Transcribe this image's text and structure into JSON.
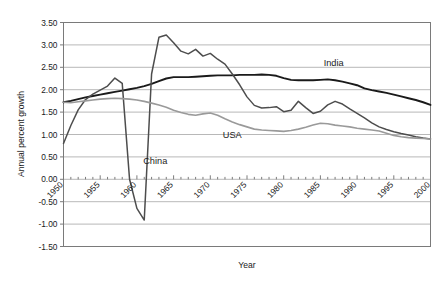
{
  "chart_data": {
    "type": "line",
    "title": "",
    "xlabel": "Year",
    "ylabel": "Annual percent growth",
    "xlim": [
      1950,
      2000
    ],
    "ylim": [
      -1.5,
      3.5
    ],
    "ytick_labels": [
      "3.50",
      "3.00",
      "2.50",
      "2.00",
      "1.50",
      "1.00",
      "0.50",
      "0.00",
      "-0.50",
      "-1.00",
      "-1.50"
    ],
    "ytick_values": [
      3.5,
      3.0,
      2.5,
      2.0,
      1.5,
      1.0,
      0.5,
      0.0,
      -0.5,
      -1.0,
      -1.5
    ],
    "xtick_labels": [
      "1950",
      "1955",
      "1960",
      "1965",
      "1970",
      "1975",
      "1980",
      "1985",
      "1990",
      "1995",
      "2000"
    ],
    "xtick_values": [
      1950,
      1955,
      1960,
      1965,
      1970,
      1975,
      1980,
      1985,
      1990,
      1995,
      2000
    ],
    "grid": true,
    "legend_position": "inline-annotations",
    "x": [
      1950,
      1951,
      1952,
      1953,
      1954,
      1955,
      1956,
      1957,
      1958,
      1959,
      1960,
      1961,
      1962,
      1963,
      1964,
      1965,
      1966,
      1967,
      1968,
      1969,
      1970,
      1971,
      1972,
      1973,
      1974,
      1975,
      1976,
      1977,
      1978,
      1979,
      1980,
      1981,
      1982,
      1983,
      1984,
      1985,
      1986,
      1987,
      1988,
      1989,
      1990,
      1991,
      1992,
      1993,
      1994,
      1995,
      1996,
      1997,
      1998,
      1999,
      2000
    ],
    "series": [
      {
        "name": "India",
        "color": "#1a1a1a",
        "width": 1.9,
        "values": [
          1.72,
          1.75,
          1.79,
          1.83,
          1.86,
          1.89,
          1.92,
          1.95,
          1.98,
          2.01,
          2.04,
          2.08,
          2.13,
          2.19,
          2.25,
          2.28,
          2.28,
          2.28,
          2.29,
          2.3,
          2.31,
          2.32,
          2.32,
          2.32,
          2.33,
          2.33,
          2.33,
          2.34,
          2.33,
          2.31,
          2.26,
          2.22,
          2.21,
          2.21,
          2.21,
          2.22,
          2.23,
          2.21,
          2.18,
          2.14,
          2.1,
          2.03,
          1.99,
          1.96,
          1.93,
          1.89,
          1.85,
          1.81,
          1.77,
          1.72,
          1.66
        ]
      },
      {
        "name": "China",
        "color": "#4d4d4d",
        "width": 1.5,
        "values": [
          0.8,
          1.2,
          1.55,
          1.78,
          1.9,
          1.99,
          2.08,
          2.26,
          2.14,
          0.0,
          -0.65,
          -0.91,
          2.35,
          3.17,
          3.22,
          3.05,
          2.86,
          2.8,
          2.9,
          2.75,
          2.81,
          2.68,
          2.57,
          2.35,
          2.11,
          1.84,
          1.65,
          1.59,
          1.6,
          1.62,
          1.51,
          1.54,
          1.74,
          1.6,
          1.47,
          1.52,
          1.66,
          1.74,
          1.68,
          1.57,
          1.47,
          1.37,
          1.26,
          1.17,
          1.11,
          1.06,
          1.02,
          0.99,
          0.95,
          0.92,
          0.9
        ]
      },
      {
        "name": "USA",
        "color": "#9a9a9a",
        "width": 1.6,
        "values": [
          1.72,
          1.71,
          1.73,
          1.75,
          1.77,
          1.79,
          1.8,
          1.81,
          1.8,
          1.79,
          1.77,
          1.74,
          1.7,
          1.66,
          1.61,
          1.54,
          1.49,
          1.45,
          1.43,
          1.46,
          1.48,
          1.43,
          1.35,
          1.28,
          1.22,
          1.17,
          1.12,
          1.1,
          1.09,
          1.08,
          1.07,
          1.09,
          1.12,
          1.16,
          1.21,
          1.25,
          1.24,
          1.21,
          1.19,
          1.17,
          1.14,
          1.12,
          1.1,
          1.08,
          1.03,
          0.98,
          0.95,
          0.93,
          0.92,
          0.91,
          0.9
        ]
      }
    ],
    "annotations": [
      {
        "label": "India",
        "x": 1986.8,
        "y": 2.53
      },
      {
        "label": "USA",
        "x": 1973.0,
        "y": 0.93
      },
      {
        "label": "China",
        "x": 1962.5,
        "y": 0.34
      }
    ]
  }
}
